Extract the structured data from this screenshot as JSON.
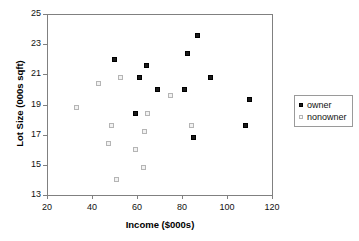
{
  "chart_data": {
    "type": "scatter",
    "title": "",
    "xlabel": "Income ($000s)",
    "ylabel": "Lot Size (000s sqft)",
    "xlim": [
      20,
      120
    ],
    "ylim": [
      13,
      25
    ],
    "xticks": [
      20,
      40,
      60,
      80,
      100,
      120
    ],
    "yticks": [
      13,
      15,
      17,
      19,
      21,
      23,
      25
    ],
    "grid": false,
    "legend_position": "right",
    "series": [
      {
        "name": "owner",
        "marker": "filled-square",
        "color": "#1a1a1a",
        "points": [
          [
            50.0,
            22.0
          ],
          [
            59.5,
            18.4
          ],
          [
            61.3,
            20.8
          ],
          [
            64.4,
            21.6
          ],
          [
            68.9,
            20.0
          ],
          [
            81.0,
            20.0
          ],
          [
            82.5,
            22.4
          ],
          [
            86.7,
            23.6
          ],
          [
            85.0,
            16.8
          ],
          [
            92.8,
            20.8
          ],
          [
            110.1,
            19.3
          ],
          [
            108.0,
            17.6
          ]
        ]
      },
      {
        "name": "nonowner",
        "marker": "open-square",
        "color": "#b5b5b5",
        "points": [
          [
            33.0,
            18.8
          ],
          [
            43.0,
            20.4
          ],
          [
            47.4,
            16.4
          ],
          [
            48.7,
            17.6
          ],
          [
            51.0,
            14.0
          ],
          [
            52.8,
            20.8
          ],
          [
            59.4,
            16.0
          ],
          [
            62.7,
            14.8
          ],
          [
            63.2,
            17.2
          ],
          [
            64.8,
            18.4
          ],
          [
            75.0,
            19.6
          ],
          [
            84.0,
            17.6
          ]
        ]
      }
    ]
  },
  "legend": {
    "items": [
      {
        "label": "owner"
      },
      {
        "label": "nonowner"
      }
    ]
  }
}
